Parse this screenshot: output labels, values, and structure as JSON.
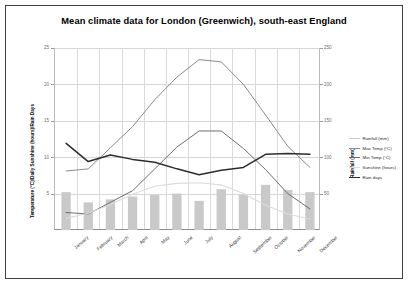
{
  "chart_data": {
    "type": "line",
    "title": "Mean climate data for London (Greenwich), south-east England",
    "categories": [
      "January",
      "February",
      "March",
      "April",
      "May",
      "June",
      "July",
      "August",
      "September",
      "October",
      "November",
      "December"
    ],
    "xlabel": "",
    "ylabel_left": "Temperature (°C)/Daily Sunshine (hours)/Rain Days",
    "ylabel_right": "Rainfall (mm)",
    "ylim_left": [
      0,
      25
    ],
    "ylim_right": [
      0,
      250
    ],
    "yticks_left": [
      5,
      10,
      15,
      20,
      25
    ],
    "yticks_right": [
      50,
      100,
      150,
      200,
      250
    ],
    "grid": true,
    "legend_position": "right",
    "series": [
      {
        "name": "Rainfall (mm)",
        "type": "bar",
        "axis": "right",
        "color": "#c9c9c9",
        "values": [
          52,
          38,
          42,
          46,
          48,
          50,
          40,
          56,
          48,
          62,
          55,
          52
        ]
      },
      {
        "name": "Max Temp (°C)",
        "type": "line",
        "axis": "left",
        "color": "#8a8a8a",
        "values": [
          8.1,
          8.4,
          11.3,
          14.2,
          17.9,
          21.0,
          23.4,
          23.1,
          20.0,
          15.8,
          11.5,
          8.6
        ]
      },
      {
        "name": "Min Temp (°C)",
        "type": "line",
        "axis": "left",
        "color": "#6d6d6d",
        "values": [
          2.4,
          2.2,
          3.8,
          5.4,
          8.4,
          11.4,
          13.6,
          13.6,
          11.2,
          8.3,
          5.0,
          2.9
        ]
      },
      {
        "name": "Sunshine (hours)",
        "type": "line",
        "axis": "left",
        "color": "#dcdcdc",
        "values": [
          1.6,
          2.3,
          3.5,
          4.9,
          6.0,
          6.4,
          6.5,
          6.2,
          5.0,
          3.4,
          2.2,
          1.5
        ]
      },
      {
        "name": "Rain days",
        "type": "line",
        "axis": "left",
        "color": "#2c2c2c",
        "values": [
          11.9,
          9.4,
          10.3,
          9.7,
          9.3,
          8.4,
          7.6,
          8.2,
          8.6,
          10.4,
          10.5,
          10.4
        ]
      }
    ]
  }
}
